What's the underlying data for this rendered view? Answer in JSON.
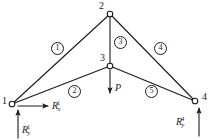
{
  "figure": {
    "type": "truss-free-body-diagram",
    "background_color": "#ffffff",
    "line_color": "#1a1a1a"
  },
  "nodes": [
    {
      "id": "1",
      "label": "1",
      "x": 12,
      "y": 104,
      "label_x": 2,
      "label_y": 96,
      "support": "pin"
    },
    {
      "id": "2",
      "label": "2",
      "x": 110,
      "y": 14,
      "label_x": 99,
      "label_y": 1,
      "support": "free"
    },
    {
      "id": "3",
      "label": "3",
      "x": 110,
      "y": 66,
      "label_x": 100,
      "label_y": 53,
      "support": "free"
    },
    {
      "id": "4",
      "label": "4",
      "x": 195,
      "y": 101,
      "label_x": 202,
      "label_y": 92,
      "support": "roller"
    }
  ],
  "members": [
    {
      "id": "1",
      "label": "1",
      "from": "1",
      "to": "2",
      "label_x": 51,
      "label_y": 42
    },
    {
      "id": "2",
      "label": "2",
      "from": "1",
      "to": "3",
      "label_x": 68,
      "label_y": 85
    },
    {
      "id": "3",
      "label": "3",
      "from": "2",
      "to": "3",
      "label_x": 114,
      "label_y": 36
    },
    {
      "id": "4",
      "label": "4",
      "from": "2",
      "to": "4",
      "label_x": 154,
      "label_y": 42
    },
    {
      "id": "5",
      "label": "5",
      "from": "3",
      "to": "4",
      "label_x": 145,
      "label_y": 85
    }
  ],
  "loads": [
    {
      "name": "applied-load",
      "symbol": "P",
      "subscript": "",
      "superscript": "",
      "at_node": "3",
      "direction": "down",
      "arrow": {
        "x1": 110,
        "y1": 70,
        "x2": 110,
        "y2": 93
      },
      "label_x": 115,
      "label_y": 83
    }
  ],
  "reactions": [
    {
      "name": "reaction-x-node1",
      "symbol": "R",
      "subscript": "x",
      "superscript": "1",
      "at_node": "1",
      "direction": "right",
      "arrow": {
        "x1": 18,
        "y1": 106,
        "x2": 48,
        "y2": 106
      },
      "label_x": 52,
      "label_y": 100
    },
    {
      "name": "reaction-y-node1",
      "symbol": "R",
      "subscript": "y",
      "superscript": "1",
      "at_node": "1",
      "direction": "up",
      "arrow": {
        "x1": 18,
        "y1": 138,
        "x2": 18,
        "y2": 110
      },
      "label_x": 22,
      "label_y": 124
    },
    {
      "name": "reaction-y-node4",
      "symbol": "R",
      "subscript": "y",
      "superscript": "4",
      "at_node": "4",
      "direction": "up",
      "arrow": {
        "x1": 199,
        "y1": 136,
        "x2": 199,
        "y2": 108
      },
      "label_x": 176,
      "label_y": 116
    }
  ]
}
